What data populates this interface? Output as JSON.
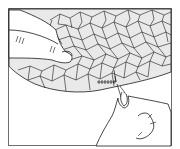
{
  "illustration": {
    "subject": "hands hand-stitching a mosaic-patterned fabric with needle and thread",
    "colors": {
      "background": "#ffffff",
      "fabric_fill": "#e9e9e9",
      "line": "#1a1a1a",
      "frame": "#6e6e6e"
    },
    "elements": [
      "left-hand",
      "fabric",
      "mosaic-pattern",
      "stitch-seam",
      "needle",
      "right-hand",
      "frame"
    ]
  }
}
